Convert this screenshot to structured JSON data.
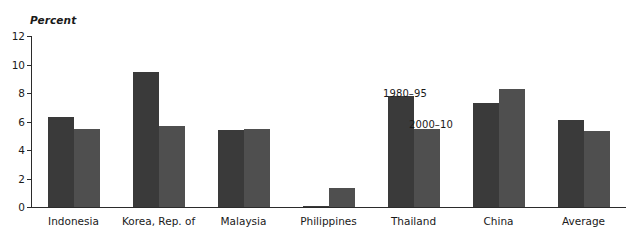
{
  "chart_data": {
    "type": "bar",
    "title": "",
    "subtitle": "",
    "ylabel": "Percent",
    "xlabel": "",
    "ylim": [
      0,
      12
    ],
    "yticks": [
      0,
      2,
      4,
      6,
      8,
      10,
      12
    ],
    "grid": false,
    "legend_position": "inline-annotation",
    "categories": [
      "Indonesia",
      "Korea, Rep. of",
      "Malaysia",
      "Philippines",
      "Thailand",
      "China",
      "Average"
    ],
    "series": [
      {
        "name": "1980–95",
        "color": "#3a3a3a",
        "values": [
          6.3,
          9.5,
          5.4,
          0.1,
          7.8,
          7.3,
          6.1
        ]
      },
      {
        "name": "2000–10",
        "color": "#4f4f4f",
        "values": [
          5.5,
          5.7,
          5.5,
          1.3,
          5.5,
          8.3,
          5.3
        ]
      }
    ],
    "annotations": [
      {
        "text": "1980–95",
        "series": 0
      },
      {
        "text": "2000–10",
        "series": 1
      }
    ]
  }
}
